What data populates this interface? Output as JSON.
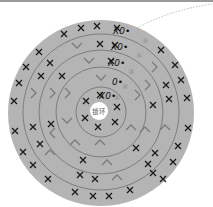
{
  "diagram": {
    "type": "crochet-round-chart",
    "center_label": "锁环",
    "rounds": [
      {
        "number": "①",
        "start_marker": "X0•"
      },
      {
        "number": "②",
        "start_marker": "0•"
      },
      {
        "number": "③",
        "start_marker": "X0•"
      },
      {
        "number": "④",
        "start_marker": "X0•"
      },
      {
        "number": "⑤",
        "start_marker": "X0•"
      }
    ],
    "symbols": {
      "x": "single crochet",
      "v": "increase",
      "0": "chain",
      "•": "slip stitch"
    },
    "colors": {
      "disc": "#b4b4b4",
      "ring_line": "#6e6e6e",
      "x_mark": "#1a1a1a",
      "v_mark": "#7a7a7a",
      "center": "#ffffff",
      "leader_line": "#aaaaaa"
    }
  }
}
